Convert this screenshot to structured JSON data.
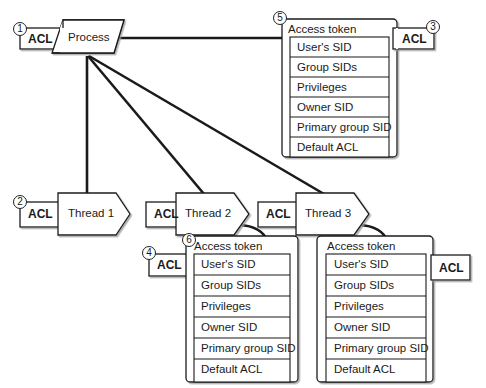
{
  "process": {
    "label": "Process",
    "acl": {
      "label": "ACL",
      "callout": "1"
    },
    "token": {
      "title": "Access token",
      "callout": "5",
      "fields": [
        "User's SID",
        "Group SIDs",
        "Privileges",
        "Owner SID",
        "Primary group SID",
        "Default ACL"
      ],
      "acl": {
        "label": "ACL",
        "callout": "3"
      }
    }
  },
  "threads": [
    {
      "label": "Thread 1",
      "acl": {
        "label": "ACL",
        "callout": "2"
      }
    },
    {
      "label": "Thread 2",
      "acl": {
        "label": "ACL"
      },
      "token": {
        "title": "Access token",
        "callout": "6",
        "fields": [
          "User's SID",
          "Group SIDs",
          "Privileges",
          "Owner SID",
          "Primary group SID",
          "Default ACL"
        ],
        "acl": {
          "label": "ACL",
          "callout": "4"
        }
      }
    },
    {
      "label": "Thread 3",
      "acl": {
        "label": "ACL"
      },
      "token": {
        "title": "Access token",
        "fields": [
          "User's SID",
          "Group SIDs",
          "Privileges",
          "Owner SID",
          "Primary group SID",
          "Default ACL"
        ],
        "acl": {
          "label": "ACL"
        }
      }
    }
  ],
  "colors": {
    "stroke": "#1a1a1a",
    "shadow": "#9a9a9a",
    "fill": "#ffffff"
  }
}
